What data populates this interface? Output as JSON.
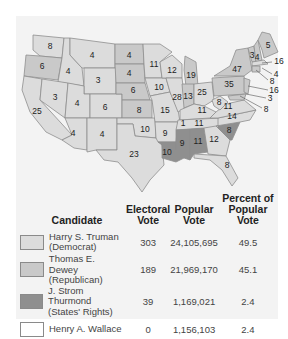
{
  "colors": {
    "democrat": "#dcdcdc",
    "republican": "#c9c9c9",
    "states_rights": "#8f8f8f",
    "wallace": "#ffffff",
    "panel_bg": "#f3f3f3",
    "border": "#8e8e8e"
  },
  "map": {
    "title": "Presidential Election of 1948",
    "states": [
      {
        "abbr": "WA",
        "votes": "8",
        "winner": "democrat"
      },
      {
        "abbr": "OR",
        "votes": "6",
        "winner": "republican"
      },
      {
        "abbr": "CA",
        "votes": "25",
        "winner": "democrat"
      },
      {
        "abbr": "ID",
        "votes": "4",
        "winner": "democrat"
      },
      {
        "abbr": "NV",
        "votes": "3",
        "winner": "democrat"
      },
      {
        "abbr": "MT",
        "votes": "4",
        "winner": "democrat"
      },
      {
        "abbr": "WY",
        "votes": "3",
        "winner": "democrat"
      },
      {
        "abbr": "UT",
        "votes": "4",
        "winner": "democrat"
      },
      {
        "abbr": "AZ",
        "votes": "4",
        "winner": "democrat"
      },
      {
        "abbr": "CO",
        "votes": "6",
        "winner": "democrat"
      },
      {
        "abbr": "NM",
        "votes": "4",
        "winner": "democrat"
      },
      {
        "abbr": "ND",
        "votes": "4",
        "winner": "republican"
      },
      {
        "abbr": "SD",
        "votes": "4",
        "winner": "republican"
      },
      {
        "abbr": "NE",
        "votes": "6",
        "winner": "republican"
      },
      {
        "abbr": "KS",
        "votes": "8",
        "winner": "republican"
      },
      {
        "abbr": "OK",
        "votes": "10",
        "winner": "democrat"
      },
      {
        "abbr": "TX",
        "votes": "23",
        "winner": "democrat"
      },
      {
        "abbr": "MN",
        "votes": "11",
        "winner": "democrat"
      },
      {
        "abbr": "IA",
        "votes": "10",
        "winner": "democrat"
      },
      {
        "abbr": "MO",
        "votes": "15",
        "winner": "democrat"
      },
      {
        "abbr": "AR",
        "votes": "9",
        "winner": "democrat"
      },
      {
        "abbr": "LA",
        "votes": "10",
        "winner": "states_rights"
      },
      {
        "abbr": "WI",
        "votes": "12",
        "winner": "democrat"
      },
      {
        "abbr": "IL",
        "votes": "28",
        "winner": "democrat"
      },
      {
        "abbr": "MI",
        "votes": "19",
        "winner": "republican"
      },
      {
        "abbr": "IN",
        "votes": "13",
        "winner": "republican"
      },
      {
        "abbr": "OH",
        "votes": "25",
        "winner": "democrat"
      },
      {
        "abbr": "KY",
        "votes": "11",
        "winner": "democrat"
      },
      {
        "abbr": "TN",
        "votes": "11",
        "winner": "democrat"
      },
      {
        "abbr": "TN-split",
        "votes": "1",
        "winner": "states_rights"
      },
      {
        "abbr": "MS",
        "votes": "9",
        "winner": "states_rights"
      },
      {
        "abbr": "AL",
        "votes": "11",
        "winner": "states_rights"
      },
      {
        "abbr": "GA",
        "votes": "12",
        "winner": "democrat"
      },
      {
        "abbr": "FL",
        "votes": "8",
        "winner": "democrat"
      },
      {
        "abbr": "SC",
        "votes": "8",
        "winner": "states_rights"
      },
      {
        "abbr": "NC",
        "votes": "14",
        "winner": "democrat"
      },
      {
        "abbr": "VA",
        "votes": "11",
        "winner": "democrat"
      },
      {
        "abbr": "WV",
        "votes": "8",
        "winner": "democrat"
      },
      {
        "abbr": "PA",
        "votes": "35",
        "winner": "republican"
      },
      {
        "abbr": "NY",
        "votes": "47",
        "winner": "republican"
      },
      {
        "abbr": "VT",
        "votes": "3",
        "winner": "republican"
      },
      {
        "abbr": "NH",
        "votes": "4",
        "winner": "republican"
      },
      {
        "abbr": "ME",
        "votes": "5",
        "winner": "republican"
      },
      {
        "abbr": "MA",
        "votes": "16",
        "winner": "democrat"
      },
      {
        "abbr": "RI",
        "votes": "4",
        "winner": "democrat"
      },
      {
        "abbr": "CT",
        "votes": "8",
        "winner": "republican"
      },
      {
        "abbr": "NJ",
        "votes": "16",
        "winner": "republican"
      },
      {
        "abbr": "DE",
        "votes": "3",
        "winner": "republican"
      },
      {
        "abbr": "MD",
        "votes": "8",
        "winner": "republican"
      }
    ]
  },
  "table": {
    "headers": {
      "candidate": "Candidate",
      "electoral_1": "Electoral",
      "electoral_2": "Vote",
      "popular_1": "Popular",
      "popular_2": "Vote",
      "percent_1": "Percent of",
      "percent_2": "Popular Vote"
    },
    "rows": [
      {
        "name": "Harry S. Truman",
        "party": "(Democrat)",
        "electoral": "303",
        "popular": "24,105,695",
        "percent": "49.5",
        "swatch": "democrat"
      },
      {
        "name": "Thomas E. Dewey",
        "party": "(Republican)",
        "electoral": "189",
        "popular": "21,969,170",
        "percent": "45.1",
        "swatch": "republican"
      },
      {
        "name": "J. Strom Thurmond",
        "party": "(States' Rights)",
        "electoral": "39",
        "popular": "1,169,021",
        "percent": "2.4",
        "swatch": "states_rights"
      },
      {
        "name": "Henry A. Wallace",
        "party": "",
        "electoral": "0",
        "popular": "1,156,103",
        "percent": "2.4",
        "swatch": "wallace"
      }
    ]
  }
}
